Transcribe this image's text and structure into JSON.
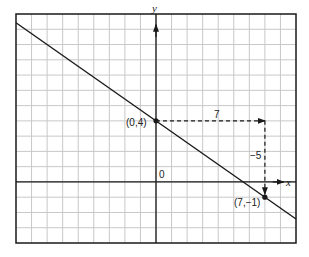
{
  "chart_data": {
    "type": "line",
    "title": "",
    "xlabel": "x",
    "ylabel": "y",
    "xlim": [
      -9,
      9
    ],
    "ylim": [
      -4,
      11
    ],
    "grid": true,
    "grid_step": 1,
    "series": [
      {
        "name": "line",
        "slope": -0.7142857,
        "intercept": 4,
        "x": [
          -9,
          9
        ],
        "y": [
          10.43,
          -2.43
        ]
      }
    ],
    "points": [
      {
        "x": 0,
        "y": 4,
        "label": "(0,4)"
      },
      {
        "x": 7,
        "y": -1,
        "label": "(7,−1)"
      }
    ],
    "annotations": [
      {
        "type": "dashed-arrow",
        "from": [
          0,
          4
        ],
        "to": [
          7,
          4
        ],
        "label": "7"
      },
      {
        "type": "dashed-arrow",
        "from": [
          7,
          4
        ],
        "to": [
          7,
          -1
        ],
        "label": "−5"
      }
    ],
    "origin_label": "0"
  },
  "colors": {
    "grid": "#c8c8c8",
    "axis": "#1a1a1a",
    "line": "#1a1a1a",
    "border": "#1a1a1a"
  }
}
